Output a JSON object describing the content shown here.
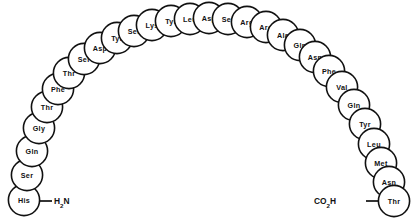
{
  "diagram": {
    "type": "peptide-sequence-arc",
    "residue_count": 31,
    "style": {
      "circle_fill": "#ffffff",
      "circle_stroke": "#111111",
      "text_color": "#111111",
      "background": "#ffffff",
      "circle_radius": 15.6
    },
    "n_terminus": {
      "label": "H",
      "subscript": "2",
      "label_tail": "N",
      "full_text": "H2N",
      "attached_residue": "His",
      "side": "left",
      "x": 52,
      "y": 201
    },
    "c_terminus": {
      "label": "CO",
      "subscript": "2",
      "label_tail": "H",
      "full_text": "CO2H",
      "attached_residue": "Thr",
      "side": "right",
      "x": 338,
      "y": 201
    },
    "residues": [
      {
        "name": "His",
        "index": 1,
        "cx": 24,
        "cy": 200
      },
      {
        "name": "Ser",
        "index": 2,
        "cx": 27,
        "cy": 175
      },
      {
        "name": "Gln",
        "index": 3,
        "cx": 32,
        "cy": 151
      },
      {
        "name": "Gly",
        "index": 4,
        "cx": 39,
        "cy": 128
      },
      {
        "name": "Thr",
        "index": 5,
        "cx": 47,
        "cy": 107
      },
      {
        "name": "Phe",
        "index": 6,
        "cx": 58,
        "cy": 89
      },
      {
        "name": "Thr",
        "index": 7,
        "cx": 69,
        "cy": 73
      },
      {
        "name": "Ser",
        "index": 8,
        "cx": 84,
        "cy": 59
      },
      {
        "name": "Asp",
        "index": 9,
        "cx": 100,
        "cy": 48
      },
      {
        "name": "Tyr",
        "index": 10,
        "cx": 117,
        "cy": 38
      },
      {
        "name": "Ser",
        "index": 11,
        "cx": 134,
        "cy": 31
      },
      {
        "name": "Lys",
        "index": 12,
        "cx": 152,
        "cy": 25
      },
      {
        "name": "Tyr",
        "index": 13,
        "cx": 171,
        "cy": 21
      },
      {
        "name": "Leu",
        "index": 14,
        "cx": 190,
        "cy": 19
      },
      {
        "name": "Asp",
        "index": 15,
        "cx": 209,
        "cy": 18
      },
      {
        "name": "Ser",
        "index": 16,
        "cx": 228,
        "cy": 19
      },
      {
        "name": "Arg",
        "index": 17,
        "cx": 247,
        "cy": 22
      },
      {
        "name": "Arg",
        "index": 18,
        "cx": 266,
        "cy": 27
      },
      {
        "name": "Ala",
        "index": 19,
        "cx": 283,
        "cy": 35
      },
      {
        "name": "Gln",
        "index": 20,
        "cx": 300,
        "cy": 45
      },
      {
        "name": "Asp",
        "index": 21,
        "cx": 315,
        "cy": 57
      },
      {
        "name": "Phe",
        "index": 22,
        "cx": 329,
        "cy": 71
      },
      {
        "name": "Val",
        "index": 23,
        "cx": 342,
        "cy": 87
      },
      {
        "name": "Gln",
        "index": 24,
        "cx": 354,
        "cy": 105
      },
      {
        "name": "Tyr",
        "index": 25,
        "cx": 365,
        "cy": 124
      },
      {
        "name": "Leu",
        "index": 26,
        "cx": 374,
        "cy": 144
      },
      {
        "name": "Met",
        "index": 27,
        "cx": 381,
        "cy": 163
      },
      {
        "name": "Asn",
        "index": 28,
        "cx": 389,
        "cy": 182
      },
      {
        "name": "Thr",
        "index": 29,
        "cx": 394,
        "cy": 201
      }
    ]
  }
}
